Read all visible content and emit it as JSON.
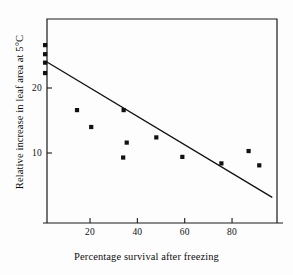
{
  "chart_data": {
    "type": "scatter",
    "title": "",
    "xlabel": "Percentage survival after freezing",
    "ylabel": "Relative increase in leaf area at 5°C",
    "xlim": [
      -1.5,
      99
    ],
    "ylim": [
      1.5,
      27.5
    ],
    "xticks": [
      20,
      40,
      60,
      80
    ],
    "xtick_labels": [
      "20",
      "40",
      "60",
      "80"
    ],
    "yticks": [
      10,
      20
    ],
    "ytick_labels": [
      "10",
      "20"
    ],
    "grid": false,
    "legend": null,
    "marker": "square",
    "marker_color": "#111111",
    "axis_color": "#1a1a1a",
    "background_color": "#fdfdfd",
    "points": [
      {
        "x": 1.0,
        "y": 26.6
      },
      {
        "x": 1.0,
        "y": 25.2
      },
      {
        "x": 1.0,
        "y": 23.9
      },
      {
        "x": 1.0,
        "y": 22.3
      },
      {
        "x": 14.5,
        "y": 16.6
      },
      {
        "x": 20.5,
        "y": 14.0
      },
      {
        "x": 34.2,
        "y": 16.6
      },
      {
        "x": 35.5,
        "y": 11.6
      },
      {
        "x": 34.0,
        "y": 9.3
      },
      {
        "x": 48.0,
        "y": 12.4
      },
      {
        "x": 59.0,
        "y": 9.4
      },
      {
        "x": 75.5,
        "y": 8.4
      },
      {
        "x": 87.0,
        "y": 10.3
      },
      {
        "x": 91.5,
        "y": 8.1
      }
    ],
    "fit_line": {
      "label": "regression line",
      "x_start": 1.8,
      "y_start": 24.0,
      "x_end": 96.8,
      "y_end": 3.2,
      "color": "#111111"
    }
  }
}
